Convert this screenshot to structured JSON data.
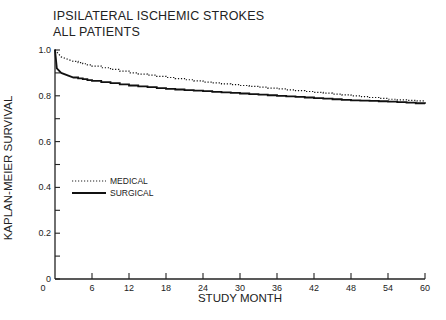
{
  "chart_data": {
    "type": "line",
    "title": "IPSILATERAL ISCHEMIC STROKES",
    "subtitle": "ALL PATIENTS",
    "xlabel": "STUDY MONTH",
    "ylabel": "KAPLAN-MEIER SURVIVAL",
    "xlim": [
      0,
      60
    ],
    "ylim": [
      0,
      1.0
    ],
    "xticks": [
      0,
      6,
      12,
      18,
      24,
      30,
      36,
      42,
      48,
      54,
      60
    ],
    "xtick_labels": [
      "0",
      "6",
      "12",
      "18",
      "24",
      "30",
      "36",
      "42",
      "48",
      "54",
      "60"
    ],
    "yticks": [
      0,
      0.1,
      0.2,
      0.3,
      0.4,
      0.5,
      0.6,
      0.7,
      0.8,
      0.9,
      1.0
    ],
    "ytick_labels": {
      "0": "0",
      "0.2": "0.2",
      "0.4": "0.4",
      "0.6": "0.6",
      "0.8": "0.8",
      "1.0": "1.0"
    },
    "grid": false,
    "legend_position": "inside-left-middle",
    "series": [
      {
        "name": "MEDICAL",
        "style": "dotted",
        "x": [
          0,
          1,
          3,
          6,
          12,
          18,
          24,
          30,
          36,
          42,
          48,
          54,
          60
        ],
        "values": [
          1.0,
          0.97,
          0.95,
          0.93,
          0.9,
          0.88,
          0.86,
          0.845,
          0.83,
          0.815,
          0.8,
          0.785,
          0.775
        ]
      },
      {
        "name": "SURGICAL",
        "style": "solid",
        "x": [
          0,
          0.3,
          1,
          3,
          6,
          12,
          18,
          24,
          30,
          36,
          42,
          48,
          54,
          60
        ],
        "values": [
          1.0,
          0.92,
          0.9,
          0.88,
          0.865,
          0.845,
          0.83,
          0.82,
          0.81,
          0.8,
          0.79,
          0.78,
          0.775,
          0.765
        ]
      }
    ]
  },
  "labels": {
    "title": "IPSILATERAL ISCHEMIC STROKES",
    "subtitle": "ALL PATIENTS",
    "xlabel": "STUDY MONTH",
    "ylabel": "KAPLAN-MEIER SURVIVAL",
    "legend_medical": "MEDICAL",
    "legend_surgical": "SURGICAL"
  }
}
